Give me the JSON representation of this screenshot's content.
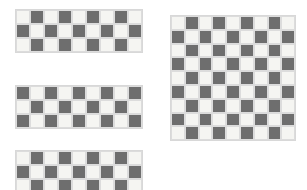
{
  "canvas": {
    "width": 307,
    "height": 190,
    "background_color": "#ffffff"
  },
  "palette": {
    "light_square_color": "#f5f5f2",
    "dark_square_color": "#6e6e6e",
    "grid_line_color": "#dcdcdc",
    "board_border_color": "#d8d8d8"
  },
  "boards": [
    {
      "id": "board-top-left",
      "label": "Top Left Checkerboard",
      "columns": 9,
      "rows": 3,
      "start_color": "light",
      "cell_size": 14,
      "x": 15,
      "y": 9,
      "clipped": false
    },
    {
      "id": "board-middle-left",
      "label": "Middle Left Checkerboard",
      "columns": 9,
      "rows": 3,
      "start_color": "dark",
      "cell_size": 14,
      "x": 15,
      "y": 85,
      "clipped": false
    },
    {
      "id": "board-bottom-left",
      "label": "Bottom Left Checkerboard",
      "columns": 9,
      "rows": 3,
      "start_color": "light",
      "cell_size": 14,
      "x": 15,
      "y": 150,
      "clipped": true
    },
    {
      "id": "board-right-large",
      "label": "Large Right Checkerboard",
      "columns": 9,
      "rows": 9,
      "start_color": "light",
      "cell_size": 13.8,
      "x": 170,
      "y": 15,
      "clipped": false
    }
  ]
}
